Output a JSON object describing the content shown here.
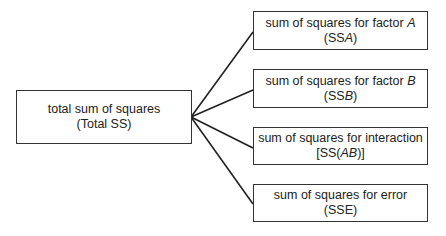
{
  "root": {
    "line1": "total sum of squares",
    "line2": "(Total SS)"
  },
  "children": [
    {
      "line1_pre": "sum of squares for factor ",
      "line1_var": "A",
      "line2_pre": "(SS",
      "line2_var": "A",
      "line2_post": ")"
    },
    {
      "line1_pre": "sum of squares for factor ",
      "line1_var": "B",
      "line2_pre": "(SS",
      "line2_var": "B",
      "line2_post": ")"
    },
    {
      "line1_pre": "sum of squares for interaction",
      "line1_var": "",
      "line2_pre": "[SS(",
      "line2_var": "AB",
      "line2_post": ")]"
    },
    {
      "line1_pre": "sum of squares for error",
      "line1_var": "",
      "line2_pre": "(SSE)",
      "line2_var": "",
      "line2_post": ""
    }
  ]
}
